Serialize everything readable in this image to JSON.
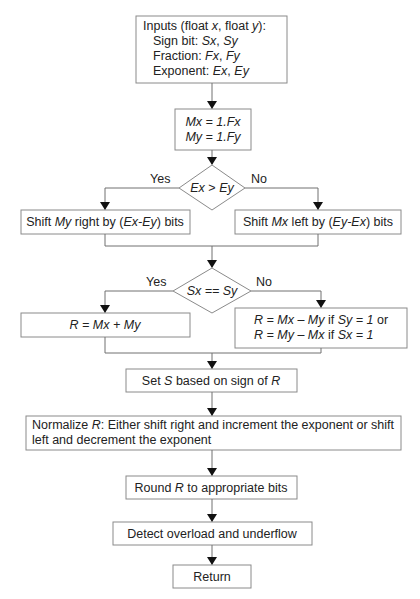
{
  "diagram": {
    "type": "flowchart",
    "nodes": {
      "inputs": {
        "lines": [
          [
            {
              "t": "Inputs (float "
            },
            {
              "t": "x",
              "i": true
            },
            {
              "t": ", float "
            },
            {
              "t": "y",
              "i": true
            },
            {
              "t": "):"
            }
          ],
          [
            {
              "t": "Sign bit: "
            },
            {
              "t": "Sx",
              "i": true
            },
            {
              "t": ", "
            },
            {
              "t": "Sy",
              "i": true
            }
          ],
          [
            {
              "t": "Fraction: "
            },
            {
              "t": "Fx",
              "i": true
            },
            {
              "t": ", "
            },
            {
              "t": "Fy",
              "i": true
            }
          ],
          [
            {
              "t": "Exponent: "
            },
            {
              "t": "Ex",
              "i": true
            },
            {
              "t": ", "
            },
            {
              "t": "Ey",
              "i": true
            }
          ]
        ]
      },
      "mantissa": {
        "lines": [
          [
            {
              "t": "Mx = 1.Fx",
              "i": true
            }
          ],
          [
            {
              "t": "My = 1.Fy",
              "i": true
            }
          ]
        ]
      },
      "decision_exp": {
        "label": [
          {
            "t": "Ex",
            "i": true
          },
          {
            "t": " > "
          },
          {
            "t": "Ey",
            "i": true
          }
        ],
        "yes_label": "Yes",
        "no_label": "No"
      },
      "shift_my": {
        "lines": [
          [
            {
              "t": "Shift "
            },
            {
              "t": "My",
              "i": true
            },
            {
              "t": " right by ("
            },
            {
              "t": "Ex-Ey",
              "i": true
            },
            {
              "t": ") bits"
            }
          ]
        ]
      },
      "shift_mx": {
        "lines": [
          [
            {
              "t": "Shift "
            },
            {
              "t": "Mx",
              "i": true
            },
            {
              "t": " left by ("
            },
            {
              "t": "Ey-Ex",
              "i": true
            },
            {
              "t": ") bits"
            }
          ]
        ]
      },
      "decision_sign": {
        "label": [
          {
            "t": "Sx == Sy",
            "i": true
          }
        ],
        "yes_label": "Yes",
        "no_label": "No"
      },
      "add": {
        "lines": [
          [
            {
              "t": "R = Mx + My",
              "i": true
            }
          ]
        ]
      },
      "subtract": {
        "lines": [
          [
            {
              "t": "R = Mx – My",
              "i": true
            },
            {
              "t": " if "
            },
            {
              "t": "Sy = 1",
              "i": true
            },
            {
              "t": "  or"
            }
          ],
          [
            {
              "t": "R = My – Mx",
              "i": true
            },
            {
              "t": " if "
            },
            {
              "t": "Sx = 1",
              "i": true
            }
          ]
        ]
      },
      "set_sign": {
        "lines": [
          [
            {
              "t": "Set "
            },
            {
              "t": "S",
              "i": true
            },
            {
              "t": " based on sign of "
            },
            {
              "t": "R",
              "i": true
            }
          ]
        ]
      },
      "normalize": {
        "lines": [
          [
            {
              "t": "Normalize "
            },
            {
              "t": "R",
              "i": true
            },
            {
              "t": ": Either shift right and increment the exponent or shift"
            }
          ],
          [
            {
              "t": "left and decrement the exponent"
            }
          ]
        ]
      },
      "round": {
        "lines": [
          [
            {
              "t": "Round "
            },
            {
              "t": "R",
              "i": true
            },
            {
              "t": " to appropriate bits"
            }
          ]
        ]
      },
      "detect": {
        "lines": [
          [
            {
              "t": "Detect overload and underflow"
            }
          ]
        ]
      },
      "return": {
        "lines": [
          [
            {
              "t": "Return"
            }
          ]
        ]
      }
    }
  }
}
